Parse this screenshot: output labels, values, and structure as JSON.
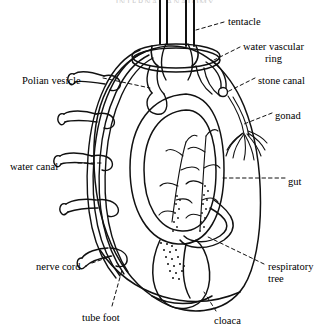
{
  "figure": {
    "title_cropped": "INTERNAL ANATOMY",
    "background_color": "#ffffff",
    "ink_color": "#111111",
    "style": "black-and-white line drawing with dashed leader lines"
  },
  "labels": [
    {
      "id": "tentacle",
      "text": "tentacle",
      "text2": "",
      "side": "right",
      "x": 228,
      "y": 16
    },
    {
      "id": "water-vascular-ring",
      "text": "water vascular",
      "text2": "ring",
      "side": "right",
      "x": 243,
      "y": 41
    },
    {
      "id": "stone-canal",
      "text": "stone canal",
      "text2": "",
      "side": "right",
      "x": 258,
      "y": 75
    },
    {
      "id": "gonad",
      "text": "gonad",
      "text2": "",
      "side": "right",
      "x": 275,
      "y": 110
    },
    {
      "id": "gut",
      "text": "gut",
      "text2": "",
      "side": "right",
      "x": 288,
      "y": 176
    },
    {
      "id": "respiratory-tree",
      "text": "respiratory",
      "text2": "tree",
      "side": "right",
      "x": 268,
      "y": 261
    },
    {
      "id": "cloaca",
      "text": "cloaca",
      "text2": "",
      "side": "right",
      "x": 214,
      "y": 315
    },
    {
      "id": "polian-vesicle",
      "text": "Polian vesicle",
      "text2": "",
      "side": "left",
      "x": 22,
      "y": 75
    },
    {
      "id": "water-canal",
      "text": "water canal",
      "text2": "",
      "side": "left",
      "x": 10,
      "y": 161
    },
    {
      "id": "nerve-cord",
      "text": "nerve cord",
      "text2": "",
      "side": "left",
      "x": 36,
      "y": 261
    },
    {
      "id": "tube-foot",
      "text": "tube foot",
      "text2": "",
      "side": "left",
      "x": 82,
      "y": 312
    }
  ],
  "structures": [
    {
      "id": "body-wall",
      "name": "body wall outline"
    },
    {
      "id": "tentacles",
      "name": "oral tentacles",
      "count": 4
    },
    {
      "id": "ring-canal",
      "name": "water vascular ring canal"
    },
    {
      "id": "stone-canal",
      "name": "stone canal"
    },
    {
      "id": "polian-vesicle",
      "name": "Polian vesicle"
    },
    {
      "id": "radial-canal",
      "name": "radial water canal with nerve cord"
    },
    {
      "id": "tube-feet",
      "name": "tube feet",
      "count": 5
    },
    {
      "id": "gut-loop",
      "name": "coiled gut"
    },
    {
      "id": "respiratory-tree",
      "name": "branched respiratory tree",
      "count": 2
    },
    {
      "id": "gonad",
      "name": "gonad tubule tuft"
    },
    {
      "id": "cloaca",
      "name": "cloaca"
    }
  ]
}
